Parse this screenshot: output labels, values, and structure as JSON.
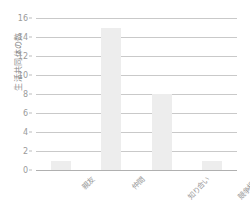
{
  "chart_data": {
    "type": "bar",
    "title": "",
    "subtitle": "",
    "xlabel": "",
    "ylabel": "生活共同体の数",
    "categories": [
      "親友",
      "仲間",
      "知り合い",
      "競争相手"
    ],
    "values": [
      1,
      15,
      8,
      1
    ],
    "ylim": [
      0,
      16
    ],
    "yticks": [
      0,
      2,
      4,
      6,
      8,
      10,
      12,
      14,
      16
    ],
    "ytick_labels": [
      "0",
      "2",
      "4",
      "6",
      "8",
      "10",
      "12",
      "14",
      "16"
    ],
    "grid": true,
    "legend": false,
    "legend_position": "none",
    "bar_color": "#ededed",
    "grid_color": "#c9c9c9",
    "axis_color": "#b0b0b0",
    "tick_label_color": "#9a9a9a",
    "axis_label_color": "#8a8a8a"
  }
}
